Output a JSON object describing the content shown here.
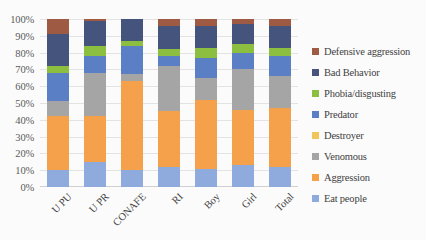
{
  "chart_data": {
    "type": "bar",
    "stacked": true,
    "stack_mode": "percent",
    "title": "",
    "xlabel": "",
    "ylabel": "",
    "ylim": [
      0,
      100
    ],
    "grid": true,
    "legend_position": "right",
    "categories": [
      "U PU",
      "U PR",
      "CONAFE",
      "RI",
      "Boy",
      "Girl",
      "Total"
    ],
    "ytick_labels": [
      "100%",
      "90%",
      "80%",
      "70%",
      "60%",
      "50%",
      "40%",
      "30%",
      "20%",
      "10%",
      "0%"
    ],
    "ytick_values": [
      100,
      90,
      80,
      70,
      60,
      50,
      40,
      30,
      20,
      10,
      0
    ],
    "series": [
      {
        "name": "Eat people",
        "color": "#8FAADC",
        "values": [
          10,
          15,
          10,
          12,
          11,
          13,
          12
        ]
      },
      {
        "name": "Aggression",
        "color": "#F5A04A",
        "values": [
          32,
          27,
          53,
          33,
          41,
          33,
          35
        ]
      },
      {
        "name": "Venomous",
        "color": "#A5A5A5",
        "values": [
          9,
          26,
          4,
          27,
          13,
          24,
          19
        ]
      },
      {
        "name": "Destroyer",
        "color": "#F2C55C",
        "values": [
          0,
          0,
          0,
          0,
          0,
          0,
          0
        ]
      },
      {
        "name": "Predator",
        "color": "#5B7FC4",
        "values": [
          17,
          10,
          17,
          6,
          12,
          10,
          12
        ]
      },
      {
        "name": "Phobia/disgusting",
        "color": "#8CBF3F",
        "values": [
          4,
          6,
          3,
          4,
          6,
          5,
          5
        ]
      },
      {
        "name": "Bad Behavior",
        "color": "#44547C",
        "values": [
          19,
          15,
          13,
          14,
          13,
          12,
          13
        ]
      },
      {
        "name": "Defensive aggression",
        "color": "#9E5A42",
        "values": [
          9,
          1,
          0,
          4,
          4,
          3,
          4
        ]
      }
    ]
  },
  "legend": {
    "items": [
      {
        "label": "Defensive aggression",
        "color": "#9E5A42"
      },
      {
        "label": "Bad Behavior",
        "color": "#44547C"
      },
      {
        "label": "Phobia/disgusting",
        "color": "#8CBF3F"
      },
      {
        "label": "Predator",
        "color": "#5B7FC4"
      },
      {
        "label": "Destroyer",
        "color": "#F2C55C"
      },
      {
        "label": "Venomous",
        "color": "#A5A5A5"
      },
      {
        "label": "Aggression",
        "color": "#F5A04A"
      },
      {
        "label": "Eat people",
        "color": "#8FAADC"
      }
    ]
  }
}
